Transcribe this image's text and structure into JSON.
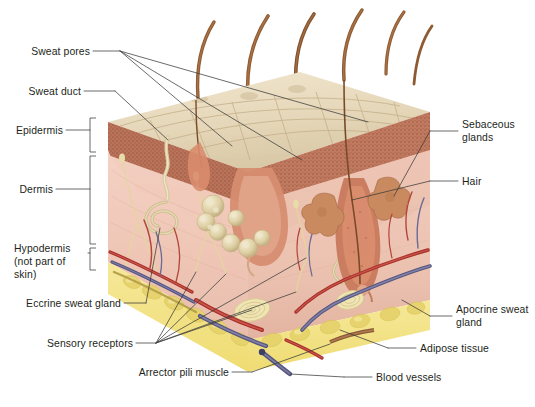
{
  "figure": {
    "type": "anatomical-illustration",
    "background": "#ffffff"
  },
  "labels": {
    "sweat_pores": "Sweat pores",
    "sweat_duct": "Sweat duct",
    "epidermis": "Epidermis",
    "dermis": "Dermis",
    "hypodermis_l1": "Hypodermis",
    "hypodermis_l2": "(not part of",
    "hypodermis_l3": "skin)",
    "eccrine_sweat_gland": "Eccrine sweat gland",
    "sensory_receptors": "Sensory receptors",
    "arrector_pili_muscle": "Arrector pili muscle",
    "sebaceous_glands_l1": "Sebaceous",
    "sebaceous_glands_l2": "glands",
    "hair": "Hair",
    "apocrine_sweat_gland_l1": "Apocrine sweat",
    "apocrine_sweat_gland_l2": "gland",
    "adipose_tissue": "Adipose tissue",
    "blood_vessels": "Blood vessels"
  },
  "colors": {
    "text": "#231f20",
    "leader": "#3a3a3a",
    "surface_top": "#e9dcc0",
    "surface_crease": "#cbb893",
    "epidermis": "#b9735a",
    "epidermis_stipple": "#9c5a43",
    "dermis": "#f0c8ba",
    "dermis_right": "#edbfae",
    "hypodermis_fat": "#f2e08a",
    "fat_lobule": "#e8d066",
    "hair_shaft": "#8d5a32",
    "follicle": "#c58064",
    "gland_pale": "#e0d2ab",
    "artery": "#b3322c",
    "vein": "#5a5a8c",
    "nerve": "#e8dca8",
    "duct": "#ddd0a8"
  }
}
